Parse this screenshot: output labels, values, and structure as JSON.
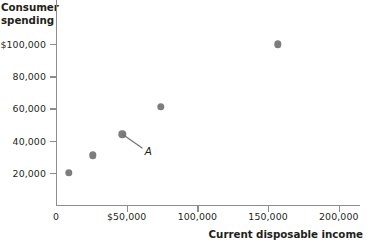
{
  "chart_data": {
    "type": "scatter",
    "title": "",
    "xlabel": "Current disposable income",
    "ylabel": "Consumer spending",
    "xlim": [
      0,
      215000
    ],
    "ylim": [
      0,
      115000
    ],
    "grid": false,
    "legend": "none",
    "x_ticks": [
      {
        "value": 0,
        "label": "0"
      },
      {
        "value": 50000,
        "label": "$50,000"
      },
      {
        "value": 100000,
        "label": "100,000"
      },
      {
        "value": 150000,
        "label": "150,000"
      },
      {
        "value": 200000,
        "label": "200,000"
      }
    ],
    "y_ticks": [
      {
        "value": 20000,
        "label": "20,000"
      },
      {
        "value": 40000,
        "label": "40,000"
      },
      {
        "value": 60000,
        "label": "60,000"
      },
      {
        "value": 80000,
        "label": "80,000"
      },
      {
        "value": 100000,
        "label": "$100,000"
      }
    ],
    "points": [
      {
        "x": 9000,
        "y": 20000,
        "label": ""
      },
      {
        "x": 26000,
        "y": 31000,
        "label": ""
      },
      {
        "x": 47000,
        "y": 44000,
        "label": "A"
      },
      {
        "x": 74000,
        "y": 61000,
        "label": ""
      },
      {
        "x": 157000,
        "y": 100000,
        "label": ""
      }
    ],
    "annotations": [
      {
        "text": "A",
        "target_x": 47000,
        "target_y": 44000
      }
    ],
    "marker_color": "#7d7d7d",
    "axis_color": "#8d8d8d"
  },
  "axes": {
    "y_title_line1": "Consumer",
    "y_title_line2": "spending",
    "x_title": "Current disposable income"
  }
}
